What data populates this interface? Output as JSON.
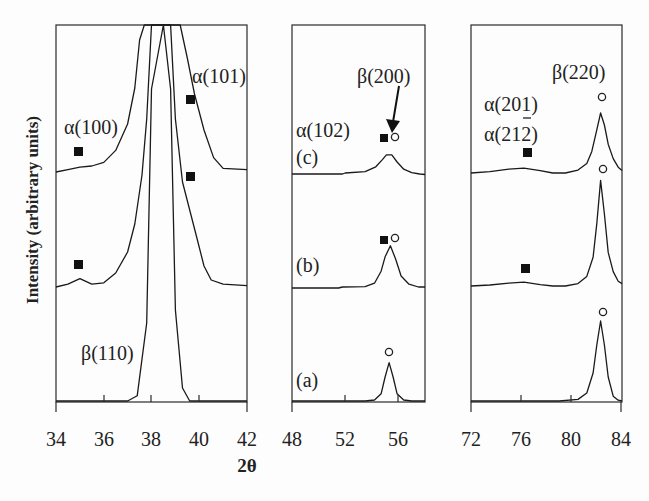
{
  "chart_data": {
    "type": "line",
    "title": "",
    "xlabel": "2θ",
    "ylabel": "Intensity (arbitrary units)",
    "legend_markers": {
      "filled_square": "α phase",
      "open_circle": "β phase"
    },
    "traces": [
      "(a)",
      "(b)",
      "(c)"
    ],
    "panels": [
      {
        "id": "panel-1",
        "xlim": [
          34,
          42
        ],
        "xticks": [
          34,
          36,
          38,
          40,
          42
        ],
        "series": [
          {
            "name": "(a)",
            "x": [
              34,
              37.0,
              37.4,
              37.8,
              38.0,
              38.5,
              38.8,
              39.0,
              39.3,
              39.6,
              42
            ],
            "y": [
              0,
              0,
              0.02,
              0.3,
              1.2,
              1.5,
              1.2,
              0.35,
              0.05,
              0,
              0
            ]
          },
          {
            "name": "(b)",
            "x": [
              34,
              34.5,
              35.0,
              35.5,
              36.0,
              36.5,
              37.0,
              37.3,
              37.6,
              37.8,
              38.0,
              38.8,
              39.0,
              39.3,
              39.6,
              39.9,
              40.2,
              40.5,
              41.0,
              42
            ],
            "y": [
              0,
              0.02,
              0.06,
              0.02,
              0.03,
              0.1,
              0.25,
              0.45,
              0.8,
              1.2,
              2.0,
              2.0,
              1.2,
              0.75,
              0.55,
              0.35,
              0.15,
              0.05,
              0.02,
              0.01
            ]
          },
          {
            "name": "(c)",
            "x": [
              34,
              34.5,
              35.0,
              35.5,
              36.0,
              36.5,
              37.0,
              37.3,
              37.5,
              37.7,
              38.0,
              38.8,
              39.0,
              39.2,
              39.5,
              39.8,
              40.2,
              40.6,
              41.0,
              42
            ],
            "y": [
              0,
              0.02,
              0.04,
              0.05,
              0.08,
              0.18,
              0.4,
              0.7,
              1.1,
              1.6,
              2.4,
              2.4,
              1.8,
              1.3,
              0.95,
              0.65,
              0.35,
              0.12,
              0.03,
              0.02
            ]
          }
        ],
        "annotations": [
          {
            "label": "α(100)",
            "phase": "alpha",
            "two_theta": 35.0
          },
          {
            "label": "α(101)",
            "phase": "alpha",
            "two_theta": 39.6
          },
          {
            "label": "β(110)",
            "phase": "beta",
            "two_theta": 38.5
          }
        ]
      },
      {
        "id": "panel-2",
        "xlim": [
          48,
          58
        ],
        "xticks": [
          48,
          52,
          56
        ],
        "series": [
          {
            "name": "(a)",
            "x": [
              48,
              53.5,
              54.2,
              54.7,
              55.0,
              55.3,
              55.6,
              55.9,
              56.4,
              57.0,
              58
            ],
            "y": [
              0,
              0,
              0.02,
              0.15,
              0.5,
              0.8,
              0.5,
              0.15,
              0.02,
              0,
              0
            ]
          },
          {
            "name": "(b)",
            "x": [
              48,
              51.5,
              51.8,
              53.5,
              54.2,
              54.7,
              55.0,
              55.4,
              55.8,
              56.2,
              56.8,
              57.5,
              58
            ],
            "y": [
              0,
              0,
              0.02,
              0.03,
              0.1,
              0.35,
              0.65,
              0.88,
              0.6,
              0.25,
              0.08,
              0.02,
              0.02
            ]
          },
          {
            "name": "(c)",
            "x": [
              48,
              51.8,
              52.0,
              53.5,
              54.3,
              54.8,
              55.1,
              55.5,
              55.9,
              56.4,
              57.0,
              57.6,
              58
            ],
            "y": [
              0,
              0,
              0.02,
              0.05,
              0.15,
              0.3,
              0.4,
              0.4,
              0.25,
              0.1,
              0.03,
              0.0,
              -0.01
            ]
          }
        ],
        "annotations": [
          {
            "label": "α(102)",
            "phase": "alpha",
            "two_theta": 55.0
          },
          {
            "label": "β(200)",
            "phase": "beta",
            "two_theta": 55.5
          }
        ]
      },
      {
        "id": "panel-3",
        "xlim": [
          72,
          84
        ],
        "xticks": [
          72,
          76,
          80,
          84
        ],
        "series": [
          {
            "name": "(a)",
            "x": [
              72,
              79.0,
              80.5,
              81.2,
              81.7,
              82.0,
              82.3,
              82.6,
              82.9,
              83.3,
              83.7,
              84
            ],
            "y": [
              0,
              0,
              0.02,
              0.1,
              0.35,
              0.7,
              1.0,
              0.7,
              0.3,
              0.06,
              0.01,
              0
            ]
          },
          {
            "name": "(b)",
            "x": [
              72,
              73.5,
              75.0,
              76.2,
              77.5,
              78.5,
              79.5,
              80.5,
              81.2,
              81.7,
              82.0,
              82.3,
              82.6,
              82.9,
              83.3,
              83.7,
              84
            ],
            "y": [
              0,
              0.02,
              0.06,
              0.08,
              0.03,
              0.0,
              0.0,
              0.05,
              0.2,
              0.6,
              1.3,
              2.2,
              1.5,
              0.7,
              0.3,
              0.1,
              0.05
            ]
          },
          {
            "name": "(c)",
            "x": [
              72,
              73.5,
              75.0,
              76.2,
              77.5,
              78.5,
              79.5,
              80.5,
              81.2,
              81.6,
              82.0,
              82.3,
              82.6,
              82.9,
              83.3,
              83.7,
              84
            ],
            "y": [
              0,
              0.03,
              0.08,
              0.1,
              0.05,
              0.0,
              0.0,
              0.06,
              0.2,
              0.45,
              0.9,
              1.25,
              1.0,
              0.6,
              0.3,
              0.12,
              0.05
            ]
          }
        ],
        "annotations": [
          {
            "label": "α(201)",
            "phase": "alpha",
            "two_theta": 76.5
          },
          {
            "label": "α(2̄12)",
            "phase": "alpha",
            "two_theta": 76.5
          },
          {
            "label": "β(220)",
            "phase": "beta",
            "two_theta": 82.3
          }
        ]
      }
    ],
    "grid": false,
    "legend_position": "none"
  },
  "labels": {
    "ylabel": "Intensity (arbitrary units)",
    "xlabel": "2θ",
    "panel1": {
      "ticks": [
        "34",
        "36",
        "38",
        "40",
        "42"
      ],
      "a100": "α(100)",
      "a101": "α(101)",
      "b110": "β(110)"
    },
    "panel2": {
      "ticks": [
        "48",
        "52",
        "56"
      ],
      "b200": "β(200)",
      "a102": "α(102)",
      "trace_c": "(c)",
      "trace_b": "(b)",
      "trace_a": "(a)"
    },
    "panel3": {
      "ticks": [
        "72",
        "76",
        "80",
        "84"
      ],
      "b220": "β(220)",
      "a201": "α(201)",
      "a212_prefix": "α(2",
      "a212_bar": "1",
      "a212_suffix": "2)"
    }
  }
}
